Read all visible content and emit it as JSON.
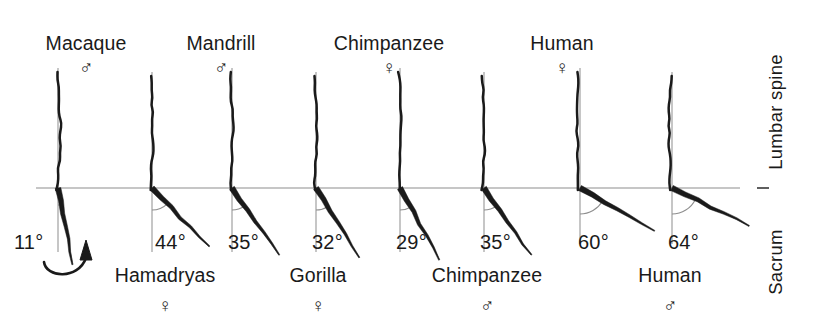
{
  "figure": {
    "type": "comparative-anatomy-diagram",
    "background_color": "#ffffff",
    "ink_color": "#1a1a1a",
    "guide_color": "#8d8d8d",
    "reference_line_y": 188,
    "side_labels": {
      "upper": "Lumbar spine",
      "lower": "Sacrum",
      "upper_x": 776,
      "upper_y": 112,
      "lower_x": 776,
      "lower_y": 262
    },
    "callout": {
      "name": "curved-arrow",
      "description": "curved arrow pointing up-right from the 11 degree label to the macaque sacrum"
    }
  },
  "chart_data": {
    "type": "diagram",
    "ylabel": "",
    "xlabel": "",
    "measurement": "Angle between vertical reference line and sacrum axis (degrees)",
    "categories": [
      "Macaque ♂",
      "Hamadryas ♀",
      "Mandrill ♂",
      "Gorilla ♀",
      "Chimpanzee ♀",
      "Chimpanzee ♂",
      "Human ♀",
      "Human ♂"
    ],
    "values": [
      11,
      44,
      35,
      32,
      29,
      35,
      60,
      64
    ],
    "value_labels": [
      "11°",
      "44°",
      "35°",
      "32°",
      "29°",
      "35°",
      "60°",
      "64°"
    ],
    "ylim": [
      0,
      90
    ],
    "grid": false,
    "legend": "none"
  },
  "specimens": [
    {
      "id": "macaque-male",
      "name": "Macaque",
      "sex": "♂",
      "sex_name": "male",
      "angle": 11,
      "angle_label": "11°",
      "label_row": "top",
      "axis_x": 58,
      "name_x": 86,
      "name_y": 34,
      "sex_x": 86,
      "sex_y": 58,
      "angle_label_x": 14,
      "angle_label_y": 232
    },
    {
      "id": "hamadryas-female",
      "name": "Hamadryas",
      "sex": "♀",
      "sex_name": "female",
      "angle": 44,
      "angle_label": "44°",
      "label_row": "bottom",
      "axis_x": 152,
      "name_x": 165,
      "name_y": 266,
      "sex_x": 165,
      "sex_y": 296,
      "angle_label_x": 155,
      "angle_label_y": 232
    },
    {
      "id": "mandrill-male",
      "name": "Mandrill",
      "sex": "♂",
      "sex_name": "male",
      "angle": 35,
      "angle_label": "35°",
      "label_row": "top",
      "axis_x": 232,
      "name_x": 221,
      "name_y": 34,
      "sex_x": 221,
      "sex_y": 58,
      "angle_label_x": 228,
      "angle_label_y": 232
    },
    {
      "id": "gorilla-female",
      "name": "Gorilla",
      "sex": "♀",
      "sex_name": "female",
      "angle": 32,
      "angle_label": "32°",
      "label_row": "bottom",
      "axis_x": 316,
      "name_x": 318,
      "name_y": 266,
      "sex_x": 318,
      "sex_y": 296,
      "angle_label_x": 312,
      "angle_label_y": 232
    },
    {
      "id": "chimpanzee-female",
      "name": "Chimpanzee",
      "sex": "♀",
      "sex_name": "female",
      "angle": 29,
      "angle_label": "29°",
      "label_row": "top",
      "axis_x": 400,
      "name_x": 389,
      "name_y": 34,
      "sex_x": 389,
      "sex_y": 58,
      "angle_label_x": 396,
      "angle_label_y": 232
    },
    {
      "id": "chimpanzee-male",
      "name": "Chimpanzee",
      "sex": "♂",
      "sex_name": "male",
      "angle": 35,
      "angle_label": "35°",
      "label_row": "bottom",
      "axis_x": 484,
      "name_x": 487,
      "name_y": 266,
      "sex_x": 487,
      "sex_y": 296,
      "angle_label_x": 480,
      "angle_label_y": 232
    },
    {
      "id": "human-female",
      "name": "Human",
      "sex": "♀",
      "sex_name": "female",
      "angle": 60,
      "angle_label": "60°",
      "label_row": "top",
      "axis_x": 580,
      "name_x": 562,
      "name_y": 34,
      "sex_x": 562,
      "sex_y": 58,
      "angle_label_x": 578,
      "angle_label_y": 232
    },
    {
      "id": "human-male",
      "name": "Human",
      "sex": "♂",
      "sex_name": "male",
      "angle": 64,
      "angle_label": "64°",
      "label_row": "bottom",
      "axis_x": 672,
      "name_x": 670,
      "name_y": 266,
      "sex_x": 670,
      "sex_y": 296,
      "angle_label_x": 668,
      "angle_label_y": 232
    }
  ]
}
